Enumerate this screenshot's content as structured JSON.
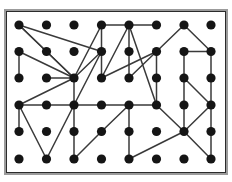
{
  "figure": {
    "type": "node-link-graph",
    "background_color": "#ffffff",
    "frame": {
      "outer_border_color": "#9b9b9b",
      "inner_border_color": "#2b2b2b",
      "outer_border_width": 2,
      "inner_border_width": 1,
      "outer": {
        "x": 4,
        "y": 9,
        "width": 224,
        "height": 166
      },
      "inner": {
        "x": 6,
        "y": 11,
        "width": 220,
        "height": 162
      }
    },
    "node_style": {
      "color": "#151515",
      "radius": 4.6,
      "count": 48
    },
    "edge_style": {
      "color": "#3a3a3a",
      "width": 1.5,
      "count": 52
    }
  },
  "chart_data": {
    "type": "scatter",
    "title": "",
    "xlabel": "",
    "ylabel": "",
    "grid": false,
    "legend": null,
    "columns": 8,
    "rows": 6,
    "col_x": [
      19,
      46.5,
      74,
      101.5,
      129,
      156.5,
      184,
      211
    ],
    "row_y": [
      25,
      51.5,
      78,
      105,
      131.5,
      159
    ],
    "nodes": [
      {
        "id": "c0r0",
        "col": 0,
        "row": 0,
        "x": 19,
        "y": 25
      },
      {
        "id": "c1r0",
        "col": 1,
        "row": 0,
        "x": 46.5,
        "y": 25
      },
      {
        "id": "c2r0",
        "col": 2,
        "row": 0,
        "x": 74,
        "y": 25
      },
      {
        "id": "c3r0",
        "col": 3,
        "row": 0,
        "x": 101.5,
        "y": 25
      },
      {
        "id": "c4r0",
        "col": 4,
        "row": 0,
        "x": 129,
        "y": 25
      },
      {
        "id": "c5r0",
        "col": 5,
        "row": 0,
        "x": 156.5,
        "y": 25
      },
      {
        "id": "c6r0",
        "col": 6,
        "row": 0,
        "x": 184,
        "y": 25
      },
      {
        "id": "c7r0",
        "col": 7,
        "row": 0,
        "x": 211,
        "y": 25
      },
      {
        "id": "c0r1",
        "col": 0,
        "row": 1,
        "x": 19,
        "y": 51.5
      },
      {
        "id": "c1r1",
        "col": 1,
        "row": 1,
        "x": 46.5,
        "y": 51.5
      },
      {
        "id": "c2r1",
        "col": 2,
        "row": 1,
        "x": 74,
        "y": 51.5
      },
      {
        "id": "c3r1",
        "col": 3,
        "row": 1,
        "x": 101.5,
        "y": 51.5
      },
      {
        "id": "c4r1",
        "col": 4,
        "row": 1,
        "x": 129,
        "y": 51.5
      },
      {
        "id": "c5r1",
        "col": 5,
        "row": 1,
        "x": 156.5,
        "y": 51.5
      },
      {
        "id": "c6r1",
        "col": 6,
        "row": 1,
        "x": 184,
        "y": 51.5
      },
      {
        "id": "c7r1",
        "col": 7,
        "row": 1,
        "x": 211,
        "y": 51.5
      },
      {
        "id": "c0r2",
        "col": 0,
        "row": 2,
        "x": 19,
        "y": 78
      },
      {
        "id": "c1r2",
        "col": 1,
        "row": 2,
        "x": 46.5,
        "y": 78
      },
      {
        "id": "c2r2",
        "col": 2,
        "row": 2,
        "x": 74,
        "y": 78
      },
      {
        "id": "c3r2",
        "col": 3,
        "row": 2,
        "x": 101.5,
        "y": 78
      },
      {
        "id": "c4r2",
        "col": 4,
        "row": 2,
        "x": 129,
        "y": 78
      },
      {
        "id": "c5r2",
        "col": 5,
        "row": 2,
        "x": 156.5,
        "y": 78
      },
      {
        "id": "c6r2",
        "col": 6,
        "row": 2,
        "x": 184,
        "y": 78
      },
      {
        "id": "c7r2",
        "col": 7,
        "row": 2,
        "x": 211,
        "y": 78
      },
      {
        "id": "c0r3",
        "col": 0,
        "row": 3,
        "x": 19,
        "y": 105
      },
      {
        "id": "c1r3",
        "col": 1,
        "row": 3,
        "x": 46.5,
        "y": 105
      },
      {
        "id": "c2r3",
        "col": 2,
        "row": 3,
        "x": 74,
        "y": 105
      },
      {
        "id": "c3r3",
        "col": 3,
        "row": 3,
        "x": 101.5,
        "y": 105
      },
      {
        "id": "c4r3",
        "col": 4,
        "row": 3,
        "x": 129,
        "y": 105
      },
      {
        "id": "c5r3",
        "col": 5,
        "row": 3,
        "x": 156.5,
        "y": 105
      },
      {
        "id": "c6r3",
        "col": 6,
        "row": 3,
        "x": 184,
        "y": 105
      },
      {
        "id": "c7r3",
        "col": 7,
        "row": 3,
        "x": 211,
        "y": 105
      },
      {
        "id": "c0r4",
        "col": 0,
        "row": 4,
        "x": 19,
        "y": 131.5
      },
      {
        "id": "c1r4",
        "col": 1,
        "row": 4,
        "x": 46.5,
        "y": 131.5
      },
      {
        "id": "c2r4",
        "col": 2,
        "row": 4,
        "x": 74,
        "y": 131.5
      },
      {
        "id": "c3r4",
        "col": 3,
        "row": 4,
        "x": 101.5,
        "y": 131.5
      },
      {
        "id": "c4r4",
        "col": 4,
        "row": 4,
        "x": 129,
        "y": 131.5
      },
      {
        "id": "c5r4",
        "col": 5,
        "row": 4,
        "x": 156.5,
        "y": 131.5
      },
      {
        "id": "c6r4",
        "col": 6,
        "row": 4,
        "x": 184,
        "y": 131.5
      },
      {
        "id": "c7r4",
        "col": 7,
        "row": 4,
        "x": 211,
        "y": 131.5
      },
      {
        "id": "c0r5",
        "col": 0,
        "row": 5,
        "x": 19,
        "y": 159
      },
      {
        "id": "c1r5",
        "col": 1,
        "row": 5,
        "x": 46.5,
        "y": 159
      },
      {
        "id": "c2r5",
        "col": 2,
        "row": 5,
        "x": 74,
        "y": 159
      },
      {
        "id": "c3r5",
        "col": 3,
        "row": 5,
        "x": 101.5,
        "y": 159
      },
      {
        "id": "c4r5",
        "col": 4,
        "row": 5,
        "x": 129,
        "y": 159
      },
      {
        "id": "c5r5",
        "col": 5,
        "row": 5,
        "x": 156.5,
        "y": 159
      },
      {
        "id": "c6r5",
        "col": 6,
        "row": 5,
        "x": 184,
        "y": 159
      },
      {
        "id": "c7r5",
        "col": 7,
        "row": 5,
        "x": 211,
        "y": 159
      }
    ],
    "edges": [
      [
        "c0r0",
        "c1r1"
      ],
      [
        "c0r0",
        "c2r2"
      ],
      [
        "c0r0",
        "c3r1"
      ],
      [
        "c0r1",
        "c0r2"
      ],
      [
        "c0r1",
        "c2r2"
      ],
      [
        "c1r1",
        "c2r2"
      ],
      [
        "c1r2",
        "c2r2"
      ],
      [
        "c2r2",
        "c2r3"
      ],
      [
        "c2r2",
        "c0r3"
      ],
      [
        "c2r2",
        "c3r0"
      ],
      [
        "c2r2",
        "c3r1"
      ],
      [
        "c0r3",
        "c1r3"
      ],
      [
        "c1r3",
        "c2r3"
      ],
      [
        "c2r3",
        "c3r3"
      ],
      [
        "c3r3",
        "c4r3"
      ],
      [
        "c4r3",
        "c5r3"
      ],
      [
        "c0r3",
        "c0r4"
      ],
      [
        "c0r3",
        "c1r5"
      ],
      [
        "c1r5",
        "c2r3"
      ],
      [
        "c2r3",
        "c2r4"
      ],
      [
        "c2r4",
        "c2r5"
      ],
      [
        "c2r5",
        "c3r4"
      ],
      [
        "c3r4",
        "c4r3"
      ],
      [
        "c4r3",
        "c4r4"
      ],
      [
        "c4r4",
        "c4r5"
      ],
      [
        "c4r5",
        "c6r4"
      ],
      [
        "c5r3",
        "c6r4"
      ],
      [
        "c3r0",
        "c4r0"
      ],
      [
        "c4r0",
        "c5r0"
      ],
      [
        "c3r0",
        "c3r1"
      ],
      [
        "c3r1",
        "c3r2"
      ],
      [
        "c4r0",
        "c4r1"
      ],
      [
        "c4r1",
        "c4r2"
      ],
      [
        "c4r0",
        "c3r2"
      ],
      [
        "c4r0",
        "c5r3"
      ],
      [
        "c4r2",
        "c5r1"
      ],
      [
        "c3r2",
        "c5r1"
      ],
      [
        "c5r1",
        "c6r0"
      ],
      [
        "c6r0",
        "c7r1"
      ],
      [
        "c6r1",
        "c7r1"
      ],
      [
        "c6r1",
        "c6r2"
      ],
      [
        "c6r2",
        "c6r3"
      ],
      [
        "c7r1",
        "c7r2"
      ],
      [
        "c7r2",
        "c7r3"
      ],
      [
        "c6r2",
        "c7r3"
      ],
      [
        "c7r3",
        "c7r4"
      ],
      [
        "c7r4",
        "c7r5"
      ],
      [
        "c6r3",
        "c6r4"
      ],
      [
        "c6r4",
        "c7r5"
      ],
      [
        "c6r4",
        "c7r3"
      ],
      [
        "c5r1",
        "c5r3"
      ],
      [
        "c2r3",
        "c3r1"
      ]
    ]
  }
}
